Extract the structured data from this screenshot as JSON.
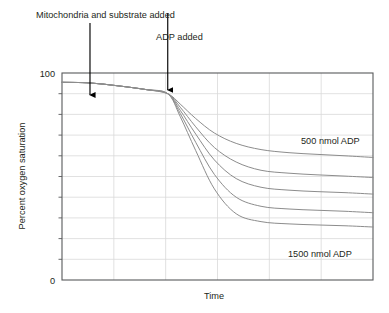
{
  "chart_data": {
    "type": "line",
    "title": "",
    "xlabel": "Time",
    "ylabel": "Percent oxygen saturation",
    "ylim": [
      0,
      100
    ],
    "xlim": [
      0,
      100
    ],
    "ytick_labels": [
      "100",
      "0"
    ],
    "ytick_values": [
      100,
      0
    ],
    "xtick_labels": [],
    "grid": "both",
    "grid_horizontal_count": 9,
    "grid_vertical_count": 5,
    "legend_position": "inline-right",
    "line_color": "#8c8c8c",
    "frame_color": "#58595b",
    "grid_color": "#d9d9d9",
    "annotations": [
      {
        "name": "mitochondria-annotation",
        "text": "Mitochondria and substrate added",
        "arrow_x": 9.0,
        "arrow_from_y": 128,
        "arrow_to_y": 101
      },
      {
        "name": "adp-annotation",
        "text": "ADP added",
        "arrow_x": 34.0,
        "arrow_from_y": 118,
        "arrow_to_y": 96
      }
    ],
    "divergence_point": {
      "x": 34.0,
      "y": 90.0
    },
    "series": [
      {
        "name": "500 nmol ADP",
        "label": "500 nmol ADP",
        "label_visible": true,
        "plateau": 60,
        "x": [
          0,
          9,
          18,
          27,
          34,
          38,
          43,
          49,
          56,
          64,
          73,
          82,
          91,
          100
        ],
        "values": [
          95.5,
          95.2,
          93.8,
          92.0,
          90.0,
          85.0,
          78.0,
          71.0,
          66.0,
          63.0,
          61.5,
          60.7,
          60.0,
          59.2
        ]
      },
      {
        "name": "750 nmol ADP",
        "label": "",
        "label_visible": false,
        "plateau": 51,
        "x": [
          0,
          9,
          18,
          27,
          34,
          38,
          43,
          49,
          56,
          64,
          73,
          82,
          91,
          100
        ],
        "values": [
          95.5,
          95.2,
          93.8,
          92.0,
          90.0,
          83.5,
          74.0,
          64.0,
          57.0,
          53.0,
          51.6,
          50.8,
          50.2,
          49.5
        ]
      },
      {
        "name": "1000 nmol ADP",
        "label": "",
        "label_visible": false,
        "plateau": 43,
        "x": [
          0,
          9,
          18,
          27,
          34,
          38,
          43,
          49,
          56,
          64,
          73,
          82,
          91,
          100
        ],
        "values": [
          95.5,
          95.2,
          93.8,
          92.0,
          90.0,
          82.0,
          70.5,
          58.0,
          49.0,
          44.8,
          43.4,
          42.7,
          42.2,
          41.5
        ]
      },
      {
        "name": "1250 nmol ADP",
        "label": "",
        "label_visible": false,
        "plateau": 34,
        "x": [
          0,
          9,
          18,
          27,
          34,
          38,
          43,
          49,
          56,
          64,
          73,
          82,
          91,
          100
        ],
        "values": [
          95.5,
          95.2,
          93.8,
          92.0,
          90.0,
          80.5,
          66.5,
          51.0,
          40.0,
          35.6,
          34.3,
          33.7,
          33.2,
          32.5
        ]
      },
      {
        "name": "1500 nmol ADP",
        "label": "1500 nmol ADP",
        "label_visible": true,
        "plateau": 27,
        "x": [
          0,
          9,
          18,
          27,
          34,
          38,
          43,
          49,
          56,
          64,
          73,
          82,
          91,
          100
        ],
        "values": [
          95.5,
          95.2,
          93.8,
          92.0,
          90.0,
          79.0,
          62.5,
          44.0,
          32.0,
          28.2,
          27.1,
          26.6,
          26.2,
          25.6
        ]
      }
    ]
  }
}
